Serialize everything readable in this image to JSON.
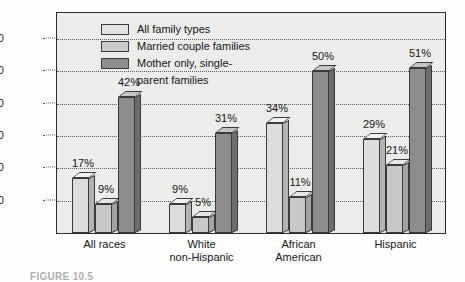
{
  "chart_data": {
    "type": "bar",
    "title": "",
    "xlabel": "",
    "ylabel": "n poverty",
    "ylim": [
      0,
      68
    ],
    "yticks": [
      10,
      20,
      30,
      40,
      50,
      60
    ],
    "grid": true,
    "legend_position": "top-left",
    "categories": [
      "All races",
      "White non-Hispanic",
      "African American",
      "Hispanic"
    ],
    "category_lines": [
      {
        "line1": "All races",
        "line2": ""
      },
      {
        "line1": "White",
        "line2": "non-Hispanic"
      },
      {
        "line1": "African",
        "line2": "American"
      },
      {
        "line1": "Hispanic",
        "line2": ""
      }
    ],
    "series": [
      {
        "name": "All family types",
        "color": "#dedddb",
        "values": [
          17,
          9,
          34,
          29
        ],
        "labels": [
          "17%",
          "9%",
          "34%",
          "29%"
        ]
      },
      {
        "name": "Married couple families",
        "color": "#c9c8c6",
        "values": [
          9,
          5,
          11,
          21
        ],
        "labels": [
          "9%",
          "5%",
          "11%",
          "21%"
        ]
      },
      {
        "name": "Mother only, single-parent families",
        "color": "#8e8d8c",
        "values": [
          42,
          31,
          50,
          51
        ],
        "labels": [
          "42%",
          "31%",
          "50%",
          "51%"
        ]
      }
    ]
  },
  "legend": {
    "items": [
      {
        "label": "All family types",
        "continuation": ""
      },
      {
        "label": "Married couple families",
        "continuation": ""
      },
      {
        "label": "Mother only, single-",
        "continuation": "parent families"
      }
    ]
  },
  "axis": {
    "y_title": "n poverty",
    "y_tick_labels": [
      "60",
      "50",
      "40",
      "30",
      "20",
      "10"
    ]
  },
  "caption": {
    "text": "FIGURE 10.5"
  }
}
